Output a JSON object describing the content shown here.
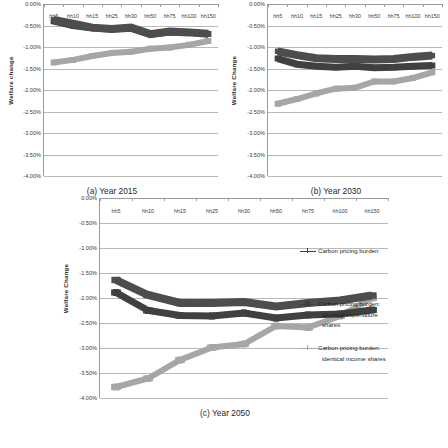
{
  "chart_data": [
    {
      "type": "line",
      "panel_id": "a",
      "title": "(a) Year 2015",
      "xlabel": "",
      "ylabel": "Welfare change",
      "ylim": [
        -4.0,
        0.0
      ],
      "yticks": [
        "0.00%",
        "-0.50%",
        "-1.00%",
        "-1.50%",
        "-2.00%",
        "-2.50%",
        "-3.00%",
        "-3.50%",
        "-4.00%"
      ],
      "ytick_values": [
        0.0,
        -0.5,
        -1.0,
        -1.5,
        -2.0,
        -2.5,
        -3.0,
        -3.5,
        -4.0
      ],
      "grid": true,
      "legend_position": "none",
      "categories": [
        "hh5",
        "hh10",
        "hh15",
        "hh25",
        "hh30",
        "hh50",
        "hh75",
        "hh100",
        "hh150"
      ],
      "series": [
        {
          "name": "Carbon pricing burden",
          "values": [
            -0.4,
            -0.5,
            -0.56,
            -0.58,
            -0.56,
            -0.7,
            -0.65,
            -0.66,
            -0.7
          ]
        },
        {
          "name": "Carbon pricing burden: identical expenditure shares",
          "values": [
            -0.37,
            -0.46,
            -0.55,
            -0.58,
            -0.55,
            -0.7,
            -0.64,
            -0.66,
            -0.69
          ]
        },
        {
          "name": "Carbon pricing burden: identical income shares",
          "values": [
            -1.36,
            -1.3,
            -1.21,
            -1.14,
            -1.11,
            -1.04,
            -1.01,
            -0.95,
            -0.86
          ]
        }
      ]
    },
    {
      "type": "line",
      "panel_id": "b",
      "title": "(b) Year 2030",
      "xlabel": "",
      "ylabel": "Welfare Change",
      "ylim": [
        -4.0,
        0.0
      ],
      "yticks": [
        "0.00%",
        "-0.50%",
        "-1.00%",
        "-1.50%",
        "-2.00%",
        "-2.50%",
        "-3.00%",
        "-3.50%",
        "-4.00%"
      ],
      "ytick_values": [
        0.0,
        -0.5,
        -1.0,
        -1.5,
        -2.0,
        -2.5,
        -3.0,
        -3.5,
        -4.0
      ],
      "grid": true,
      "legend_position": "none",
      "categories": [
        "hh5",
        "hh10",
        "hh15",
        "hh25",
        "hh30",
        "hh50",
        "hh75",
        "hh100",
        "hh150"
      ],
      "series": [
        {
          "name": "Carbon pricing burden",
          "values": [
            -1.27,
            -1.4,
            -1.45,
            -1.47,
            -1.45,
            -1.48,
            -1.47,
            -1.45,
            -1.43
          ]
        },
        {
          "name": "Carbon pricing burden: identical expenditure shares",
          "values": [
            -1.1,
            -1.19,
            -1.26,
            -1.28,
            -1.28,
            -1.29,
            -1.28,
            -1.23,
            -1.2
          ]
        },
        {
          "name": "Carbon pricing burden: identical income shares",
          "values": [
            -2.32,
            -2.21,
            -2.08,
            -1.97,
            -1.95,
            -1.8,
            -1.8,
            -1.72,
            -1.59
          ]
        }
      ]
    },
    {
      "type": "line",
      "panel_id": "c",
      "title": "(c) Year 2050",
      "xlabel": "",
      "ylabel": "Welfare Change",
      "ylim": [
        -4.0,
        0.0
      ],
      "yticks": [
        "0.00%",
        "-0.50%",
        "-1.00%",
        "-1.50%",
        "-2.00%",
        "-2.50%",
        "-3.00%",
        "-3.50%",
        "-4.00%"
      ],
      "ytick_values": [
        0.0,
        -0.5,
        -1.0,
        -1.5,
        -2.0,
        -2.5,
        -3.0,
        -3.5,
        -4.0
      ],
      "grid": true,
      "legend_position": "right",
      "categories": [
        "hh5",
        "hh10",
        "hh15",
        "hh25",
        "hh30",
        "hh50",
        "hh75",
        "hh100",
        "hh150"
      ],
      "series": [
        {
          "name": "Carbon pricing burden",
          "values": [
            -1.89,
            -2.25,
            -2.35,
            -2.36,
            -2.3,
            -2.4,
            -2.34,
            -2.32,
            -2.24
          ]
        },
        {
          "name": "Carbon pricing burden: identical expenditure shares",
          "values": [
            -1.64,
            -1.94,
            -2.1,
            -2.1,
            -2.08,
            -2.17,
            -2.1,
            -2.05,
            -1.95
          ]
        },
        {
          "name": "Carbon pricing burden: identical income shares",
          "values": [
            -3.78,
            -3.61,
            -3.24,
            -2.99,
            -2.92,
            -2.56,
            -2.59,
            -2.36,
            -2.0
          ]
        }
      ]
    }
  ],
  "legend": {
    "items": [
      {
        "label_line1": "Carbon pricing burden",
        "label_line2": "",
        "label_line3": "",
        "color": "#404040",
        "marker": "plus"
      },
      {
        "label_line1": "Carbon pricing burden:",
        "label_line2": "identical expenditure",
        "label_line3": "shares",
        "color": "#404040",
        "marker": "square"
      },
      {
        "label_line1": "Carbon pricing burden:",
        "label_line2": "identical income shares",
        "label_line3": "",
        "color": "#a6a6a6",
        "marker": "plus"
      }
    ]
  },
  "colors": {
    "series_dark": "#404040",
    "series_medium": "#4d4d4d",
    "series_light": "#a6a6a6",
    "gridline": "#b9b9b9",
    "axis": "#9a9a9a",
    "text": "#231f20"
  }
}
